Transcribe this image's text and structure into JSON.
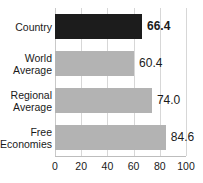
{
  "chart_data": {
    "type": "bar",
    "orientation": "horizontal",
    "title": "Economic Freedom Score",
    "categories": [
      "Country",
      "World Average",
      "Regional Average",
      "Free Economies"
    ],
    "values": [
      66.4,
      60.4,
      74.0,
      84.6
    ],
    "value_labels": [
      "66.4",
      "60.4",
      "74.0",
      "84.6"
    ],
    "highlight_index": 0,
    "xlabel": "",
    "ylabel": "",
    "xlim": [
      0,
      100
    ],
    "xticks": [
      0,
      20,
      40,
      60,
      80,
      100
    ],
    "xtick_labels": [
      "0",
      "20",
      "40",
      "60",
      "80",
      "100"
    ],
    "grid": true,
    "legend": false,
    "colors": {
      "highlight_bar": "#1c1c1c",
      "normal_bar": "#b3b3b3",
      "gridline": "#d7d7d7",
      "axis": "#bdbdbd",
      "text": "#1a1a1a",
      "background": "#ffffff"
    }
  },
  "category_label_lines": [
    [
      "Country"
    ],
    [
      "World",
      "Average"
    ],
    [
      "Regional",
      "Average"
    ],
    [
      "Free",
      "Economies"
    ]
  ]
}
